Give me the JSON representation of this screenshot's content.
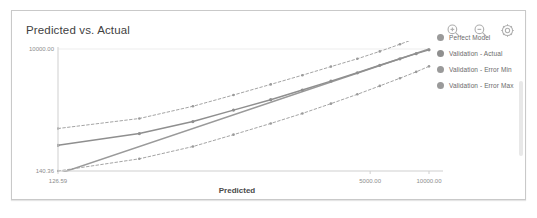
{
  "card": {
    "title": "Predicted vs. Actual"
  },
  "toolbar": {
    "items": [
      {
        "name": "zoom-in-icon",
        "label": "Zoom In"
      },
      {
        "name": "zoom-out-icon",
        "label": "Zoom Out"
      },
      {
        "name": "settings-gear-icon",
        "label": "Settings"
      }
    ]
  },
  "legend": {
    "position": "right",
    "items": [
      {
        "label": "Perfect Model",
        "color": "#9a9a9a"
      },
      {
        "label": "Validation - Actual",
        "color": "#8f8f8f"
      },
      {
        "label": "Validation - Error Min",
        "color": "#9a9a9a"
      },
      {
        "label": "Validation - Error Max",
        "color": "#9a9a9a"
      }
    ]
  },
  "chart_data": {
    "type": "line",
    "title": "Predicted vs. Actual",
    "xlabel": "Predicted",
    "ylabel": "",
    "grid": true,
    "scale": "log",
    "xticks": [
      "126.59",
      "5000.00",
      "10000.00"
    ],
    "xtick_values": [
      126.59,
      5000.0,
      10000.0
    ],
    "yticks": [
      "140.36",
      "10000.00"
    ],
    "ytick_values": [
      140.36,
      10000.0
    ],
    "xlim": [
      126.59,
      10000.0
    ],
    "ylim": [
      140.36,
      10000.0
    ],
    "legend_position": "right",
    "series": [
      {
        "name": "Perfect Model",
        "style": "solid",
        "color": "#9a9a9a",
        "markers": false,
        "x": [
          126.59,
          10000.0
        ],
        "y": [
          126.59,
          10000.0
        ]
      },
      {
        "name": "Validation - Actual",
        "style": "solid",
        "color": "#8f8f8f",
        "markers": true,
        "x": [
          126.59,
          330.0,
          620.0,
          1000.0,
          1550.0,
          2250.0,
          3150.0,
          4300.0,
          5600.0,
          7100.0,
          8600.0,
          10000.0
        ],
        "y": [
          345.0,
          520.0,
          790.0,
          1180.0,
          1700.0,
          2380.0,
          3250.0,
          4350.0,
          5650.0,
          7100.0,
          8500.0,
          9700.0
        ]
      },
      {
        "name": "Validation - Error Max",
        "style": "dashed",
        "color": "#9a9a9a",
        "markers": true,
        "x": [
          126.59,
          330.0,
          620.0,
          1000.0,
          1550.0,
          2250.0,
          3150.0,
          4300.0,
          5600.0,
          7100.0,
          8600.0,
          10000.0
        ],
        "y": [
          620.0,
          880.0,
          1350.0,
          2000.0,
          2900.0,
          4000.0,
          5400.0,
          7100.0,
          9200.0,
          11800.0,
          14600.0,
          17500.0
        ]
      },
      {
        "name": "Validation - Error Min",
        "style": "dashed",
        "color": "#9a9a9a",
        "markers": true,
        "x": [
          126.59,
          330.0,
          620.0,
          1000.0,
          1550.0,
          2250.0,
          3150.0,
          4300.0,
          5600.0,
          7100.0,
          8600.0,
          10000.0
        ],
        "y": [
          140.36,
          215.0,
          330.0,
          500.0,
          740.0,
          1050.0,
          1480.0,
          2050.0,
          2750.0,
          3600.0,
          4500.0,
          5450.0
        ]
      }
    ]
  }
}
